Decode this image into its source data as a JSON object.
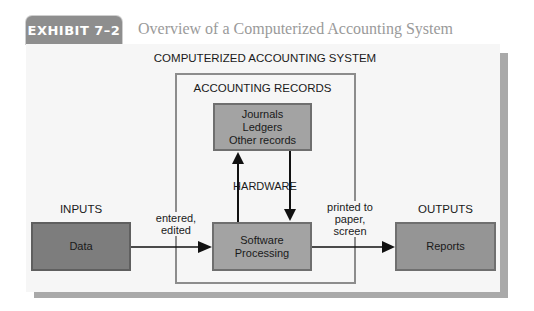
{
  "header": {
    "exhibit_label": "EXHIBIT 7–2",
    "title": "Overview of a Computerized Accounting System"
  },
  "diagram": {
    "system_title": "COMPUTERIZED ACCOUNTING SYSTEM",
    "records_title": "ACCOUNTING RECORDS",
    "records_box": {
      "line1": "Journals",
      "line2": "Ledgers",
      "line3": "Other records"
    },
    "hardware_label": "HARDWARE",
    "software_box": {
      "line1": "Software",
      "line2": "Processing"
    },
    "inputs": {
      "title": "INPUTS",
      "box": "Data"
    },
    "outputs": {
      "title": "OUTPUTS",
      "box": "Reports"
    },
    "input_edge_label": {
      "line1": "entered,",
      "line2": "edited"
    },
    "output_edge_label": {
      "line1": "printed to",
      "line2": "paper,",
      "line3": "screen"
    },
    "colors": {
      "panel_bg": "#f6f6f6",
      "shadow": "#a9a9a9",
      "box_light": "#a3a3a3",
      "box_dark": "#7d7d7d",
      "tab_bg": "#8e8e8e"
    }
  }
}
